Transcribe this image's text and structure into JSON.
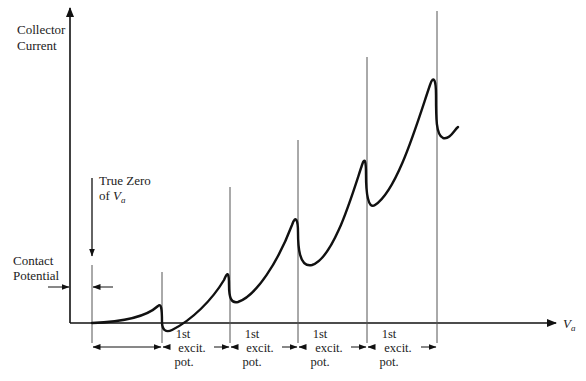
{
  "diagram": {
    "y_axis_label_line1": "Collector",
    "y_axis_label_line2": "Current",
    "x_axis_label": "V",
    "x_axis_label_sub": "a",
    "true_zero_line1": "True Zero",
    "true_zero_line2_prefix": "of ",
    "true_zero_var": "V",
    "true_zero_sub": "a",
    "contact_potential_line1": "Contact",
    "contact_potential_line2": "Potential",
    "intervals": [
      {
        "line1": "1st",
        "line2": "excit.",
        "line3": "pot."
      },
      {
        "line1": "1st",
        "line2": "excit.",
        "line3": "pot."
      },
      {
        "line1": "1st",
        "line2": "excit.",
        "line3": "pot."
      },
      {
        "line1": "1st",
        "line2": "excit.",
        "line3": "pot."
      }
    ],
    "colors": {
      "ink": "#111111",
      "guide": "#555555"
    }
  }
}
